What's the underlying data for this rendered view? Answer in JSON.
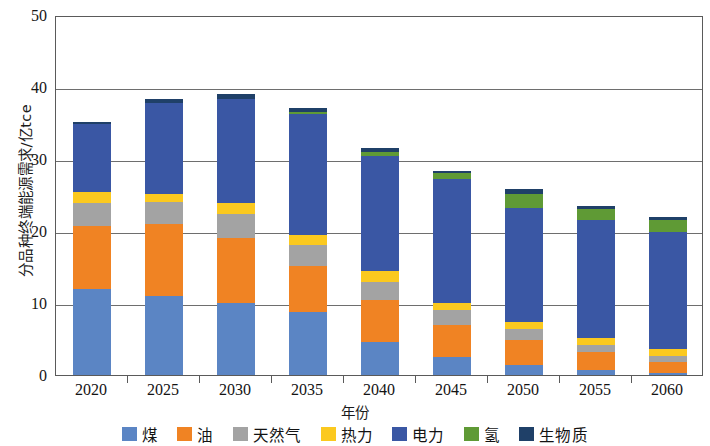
{
  "chart_data": {
    "type": "bar",
    "stacked": true,
    "title": "",
    "xlabel": "年份",
    "ylabel": "分品种终端能源需求/亿tce",
    "categories": [
      "2020",
      "2025",
      "2030",
      "2035",
      "2040",
      "2045",
      "2050",
      "2055",
      "2060"
    ],
    "ylim": [
      0,
      50
    ],
    "yticks": [
      0,
      10,
      20,
      30,
      40,
      50
    ],
    "ytick_labels": [
      "0",
      "10",
      "20",
      "30",
      "40",
      "50"
    ],
    "grid": true,
    "legend_position": "bottom",
    "units": "亿tce",
    "series": [
      {
        "name": "煤",
        "color": "#5b85c4",
        "values": [
          12.0,
          11.0,
          10.0,
          8.7,
          4.6,
          2.5,
          1.4,
          0.7,
          0.3
        ]
      },
      {
        "name": "油",
        "color": "#f08323",
        "values": [
          8.7,
          10.0,
          9.0,
          6.5,
          5.8,
          4.5,
          3.5,
          2.5,
          1.5
        ]
      },
      {
        "name": "天然气",
        "color": "#a3a3a3",
        "values": [
          3.2,
          3.0,
          3.3,
          2.8,
          2.5,
          2.0,
          1.5,
          1.0,
          0.8
        ]
      },
      {
        "name": "热力",
        "color": "#fbc91f",
        "values": [
          1.5,
          1.2,
          1.6,
          1.5,
          1.5,
          1.0,
          1.0,
          0.9,
          1.0
        ]
      },
      {
        "name": "电力",
        "color": "#3a57a4",
        "values": [
          9.4,
          12.6,
          14.4,
          16.7,
          16.0,
          17.2,
          15.8,
          16.5,
          16.3
        ]
      },
      {
        "name": "氢",
        "color": "#5f9a35",
        "values": [
          0.0,
          0.0,
          0.1,
          0.3,
          0.6,
          0.8,
          1.9,
          1.5,
          1.6
        ]
      },
      {
        "name": "生物质",
        "color": "#1f4068",
        "values": [
          0.4,
          0.5,
          0.6,
          0.6,
          0.5,
          0.4,
          0.7,
          0.4,
          0.4
        ]
      }
    ],
    "totals": [
      35.2,
      38.3,
      39.0,
      37.1,
      31.5,
      28.4,
      25.8,
      23.5,
      21.9
    ]
  },
  "axis": {
    "y_title": "分品种终端能源需求/亿tce",
    "x_title": "年份"
  },
  "legend": {
    "items": [
      {
        "label": "煤",
        "color": "#5b85c4"
      },
      {
        "label": "油",
        "color": "#f08323"
      },
      {
        "label": "天然气",
        "color": "#a3a3a3"
      },
      {
        "label": "热力",
        "color": "#fbc91f"
      },
      {
        "label": "电力",
        "color": "#3a57a4"
      },
      {
        "label": "氢",
        "color": "#5f9a35"
      },
      {
        "label": "生物质",
        "color": "#1f4068"
      }
    ]
  }
}
